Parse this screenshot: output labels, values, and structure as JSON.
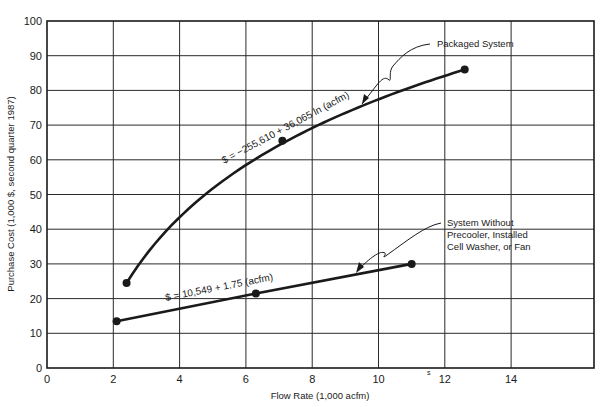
{
  "chart_data": {
    "type": "line",
    "title": "",
    "xlabel": "Flow Rate (1,000 acfm)",
    "ylabel": "Purchase Cost (1,000 $, second quarter 1987)",
    "xlim": [
      0,
      16.5
    ],
    "ylim": [
      0,
      100
    ],
    "x_ticks": [
      0,
      2,
      4,
      6,
      8,
      10,
      12,
      14
    ],
    "y_ticks": [
      0,
      10,
      20,
      30,
      40,
      50,
      60,
      70,
      80,
      90,
      100
    ],
    "grid": true,
    "legend": "none (inline annotations)",
    "series": [
      {
        "name": "Packaged System",
        "equation": "$ = -255,610 + 36,065 ln (acfm)",
        "curve": "logarithmic",
        "points": [
          [
            2.4,
            24.5
          ],
          [
            7.1,
            65.5
          ],
          [
            12.6,
            86.0
          ]
        ]
      },
      {
        "name": "System Without Precooler, Installed Cell Washer, or Fan",
        "equation": "$ = 10,549 + 1.75 (acfm)",
        "curve": "linear",
        "points": [
          [
            2.1,
            13.5
          ],
          [
            6.3,
            21.5
          ],
          [
            11.0,
            30.0
          ]
        ]
      }
    ],
    "annotations": [
      {
        "text": "Packaged System",
        "target_series": 0
      },
      {
        "text": [
          "System Without",
          "Precooler, Installed",
          "Cell Washer, or Fan"
        ],
        "target_series": 1
      },
      {
        "text": "$ = -255,610 + 36,065 ln (acfm)",
        "along_series": 0
      },
      {
        "text": "$ = 10,549 + 1.75 (acfm)",
        "along_series": 1
      }
    ]
  },
  "labels": {
    "xlabel": "Flow Rate (1,000 acfm)",
    "ylabel": "Purchase Cost (1,000 $, second quarter 1987)",
    "packaged": "Packaged System",
    "without_1": "System Without",
    "without_2": "Precooler, Installed",
    "without_3": "Cell Washer, or Fan",
    "eq_packaged": "$ = −255,610 + 36,065 ln (acfm)",
    "eq_without": "$ = 10,549 + 1.75 (acfm)",
    "stray_mark": "s"
  },
  "colors": {
    "ink": "#1a1a1a",
    "grid": "#2a2a2a",
    "background": "#ffffff"
  }
}
